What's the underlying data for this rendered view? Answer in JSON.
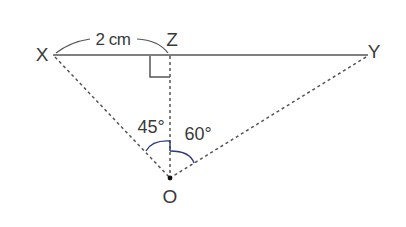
{
  "diagram": {
    "points": {
      "X": {
        "label": "X",
        "x": 53,
        "y": 55
      },
      "Z": {
        "label": "Z",
        "x": 170,
        "y": 55
      },
      "Y": {
        "label": "Y",
        "x": 368,
        "y": 55
      },
      "O": {
        "label": "O",
        "x": 170,
        "y": 178
      }
    },
    "segments": [
      {
        "from": "X",
        "to": "Y",
        "style": "solid"
      },
      {
        "from": "Z",
        "to": "O",
        "style": "dashed"
      },
      {
        "from": "X",
        "to": "O",
        "style": "dashed"
      },
      {
        "from": "Y",
        "to": "O",
        "style": "dashed"
      }
    ],
    "measure_label": "2 cm",
    "angles": [
      {
        "label": "45°",
        "between": [
          "X",
          "Z"
        ],
        "vertex": "O"
      },
      {
        "label": "60°",
        "between": [
          "Z",
          "Y"
        ],
        "vertex": "O"
      }
    ],
    "right_angle_at": "Z",
    "colors": {
      "line": "#555555",
      "text": "#3a3a3a",
      "arc_left": "#2a3a80",
      "arc_right": "#2a3a80"
    }
  }
}
